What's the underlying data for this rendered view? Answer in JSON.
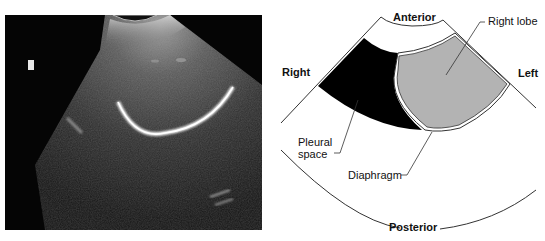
{
  "ultrasound": {
    "description": "Sagittal ultrasound image showing liver right lobe, diaphragm and pleural space",
    "marker": "orientation-marker"
  },
  "diagram": {
    "orientation_labels": {
      "anterior": "Anterior",
      "posterior": "Posterior",
      "right": "Right",
      "left": "Left"
    },
    "structure_labels": {
      "right_lobe": "Right lobe",
      "pleural_space_line1": "Pleural",
      "pleural_space_line2": "space",
      "diaphragm": "Diaphragm"
    },
    "colors": {
      "pleural_space": "#000000",
      "right_lobe": "#b3b3b3",
      "outline": "#222222",
      "background": "#ffffff"
    }
  }
}
